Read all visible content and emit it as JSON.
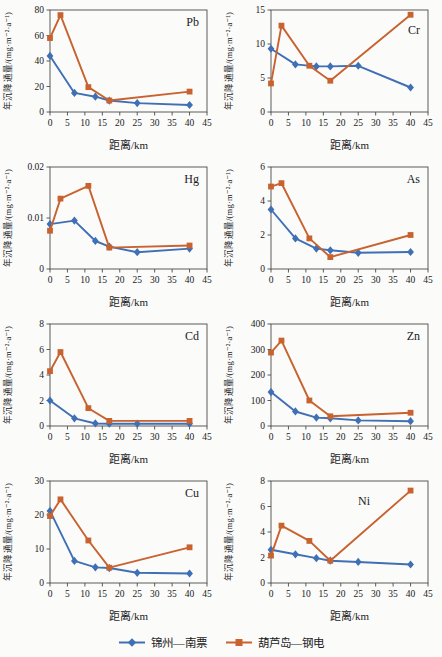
{
  "figure": {
    "background": "#fbfbfa",
    "series_styles": [
      {
        "name": "锦州—南票",
        "color": "#3f6fb5",
        "marker": "diamond"
      },
      {
        "name": "葫芦岛—钢电",
        "color": "#c8622f",
        "marker": "square"
      }
    ]
  },
  "legend": {
    "position": "bottom-center",
    "items": [
      {
        "label": "锦州—南票",
        "color": "#3f6fb5",
        "marker": "diamond"
      },
      {
        "label": "葫芦岛—钢电",
        "color": "#c8622f",
        "marker": "square"
      }
    ]
  },
  "chart_data": [
    {
      "type": "line",
      "title": "Pb",
      "xlabel": "距离/km",
      "ylabel": "年沉降通量/(mg·m⁻²·a⁻¹)",
      "xlim": [
        0,
        45
      ],
      "xtick_step": 5,
      "ylim": [
        0,
        80
      ],
      "ytick_step": 20,
      "grid": false,
      "title_offset": [
        0,
        0
      ],
      "series": [
        {
          "name": "锦州—南票",
          "x": [
            0,
            7,
            13,
            17,
            25,
            40
          ],
          "y": [
            44,
            15,
            12,
            9,
            7,
            5.5
          ]
        },
        {
          "name": "葫芦岛—钢电",
          "x": [
            0,
            3,
            11,
            17,
            40
          ],
          "y": [
            58,
            76,
            19.5,
            9,
            16
          ]
        }
      ]
    },
    {
      "type": "line",
      "title": "Cr",
      "xlabel": "距离/km",
      "ylabel": "年沉降通量/(mg·m⁻²·a⁻¹)",
      "xlim": [
        0,
        45
      ],
      "xtick_step": 5,
      "ylim": [
        0,
        15
      ],
      "ytick_step": 5,
      "grid": false,
      "title_offset": [
        0,
        8
      ],
      "series": [
        {
          "name": "锦州—南票",
          "x": [
            0,
            7,
            13,
            17,
            25,
            40
          ],
          "y": [
            9.3,
            7,
            6.7,
            6.7,
            6.8,
            3.6
          ]
        },
        {
          "name": "葫芦岛—钢电",
          "x": [
            0,
            3,
            11,
            17,
            40
          ],
          "y": [
            4.2,
            12.7,
            6.8,
            4.6,
            14.3
          ]
        }
      ]
    },
    {
      "type": "line",
      "title": "Hg",
      "xlabel": "距离/km",
      "ylabel": "年沉降通量/(mg·m⁻²·a⁻¹)",
      "xlim": [
        0,
        45
      ],
      "xtick_step": 5,
      "ylim": [
        0,
        0.02
      ],
      "ytick_step": 0.01,
      "grid": false,
      "title_offset": [
        0,
        0
      ],
      "series": [
        {
          "name": "锦州—南票",
          "x": [
            0,
            7,
            13,
            17,
            25,
            40
          ],
          "y": [
            0.0088,
            0.0095,
            0.0055,
            0.0044,
            0.0033,
            0.004
          ]
        },
        {
          "name": "葫芦岛—钢电",
          "x": [
            0,
            3,
            11,
            17,
            40
          ],
          "y": [
            0.0075,
            0.0138,
            0.0163,
            0.0042,
            0.0046
          ]
        }
      ]
    },
    {
      "type": "line",
      "title": "As",
      "xlabel": "距离/km",
      "ylabel": "年沉降通量/(mg·m⁻²·a⁻¹)",
      "xlim": [
        0,
        45
      ],
      "xtick_step": 5,
      "ylim": [
        0,
        6
      ],
      "ytick_step": 2,
      "grid": false,
      "title_offset": [
        0,
        0
      ],
      "series": [
        {
          "name": "锦州—南票",
          "x": [
            0,
            7,
            13,
            17,
            25,
            40
          ],
          "y": [
            3.5,
            1.8,
            1.2,
            1.1,
            0.95,
            1.0
          ]
        },
        {
          "name": "葫芦岛—钢电",
          "x": [
            0,
            3,
            11,
            17,
            40
          ],
          "y": [
            4.85,
            5.05,
            1.8,
            0.7,
            2.0
          ]
        }
      ]
    },
    {
      "type": "line",
      "title": "Cd",
      "xlabel": "距离/km",
      "ylabel": "年沉降通量/(mg·m⁻²·a⁻¹)",
      "xlim": [
        0,
        45
      ],
      "xtick_step": 5,
      "ylim": [
        0,
        8
      ],
      "ytick_step": 2,
      "grid": false,
      "title_offset": [
        0,
        0
      ],
      "series": [
        {
          "name": "锦州—南票",
          "x": [
            0,
            7,
            13,
            17,
            25,
            40
          ],
          "y": [
            2.0,
            0.6,
            0.2,
            0.18,
            0.18,
            0.18
          ]
        },
        {
          "name": "葫芦岛—钢电",
          "x": [
            0,
            3,
            11,
            17,
            40
          ],
          "y": [
            4.3,
            5.8,
            1.4,
            0.4,
            0.4
          ]
        }
      ]
    },
    {
      "type": "line",
      "title": "Zn",
      "xlabel": "距离/km",
      "ylabel": "年沉降通量/(mg·m⁻²·a⁻¹)",
      "xlim": [
        0,
        45
      ],
      "xtick_step": 5,
      "ylim": [
        0,
        400
      ],
      "ytick_step": 100,
      "grid": false,
      "title_offset": [
        0,
        0
      ],
      "series": [
        {
          "name": "锦州—南票",
          "x": [
            0,
            7,
            13,
            17,
            25,
            40
          ],
          "y": [
            133,
            57,
            33,
            30,
            22,
            19
          ]
        },
        {
          "name": "葫芦岛—钢电",
          "x": [
            0,
            3,
            11,
            17,
            40
          ],
          "y": [
            288,
            335,
            100,
            38,
            52
          ]
        }
      ]
    },
    {
      "type": "line",
      "title": "Cu",
      "xlabel": "距离/km",
      "ylabel": "年沉降通量/(mg·m⁻²·a⁻¹)",
      "xlim": [
        0,
        45
      ],
      "xtick_step": 5,
      "ylim": [
        0,
        30
      ],
      "ytick_step": 10,
      "grid": false,
      "title_offset": [
        0,
        0
      ],
      "series": [
        {
          "name": "锦州—南票",
          "x": [
            0,
            7,
            13,
            17,
            25,
            40
          ],
          "y": [
            21.2,
            6.5,
            4.6,
            4.4,
            3.0,
            2.8
          ]
        },
        {
          "name": "葫芦岛—钢电",
          "x": [
            0,
            3,
            11,
            17,
            40
          ],
          "y": [
            19.7,
            24.6,
            12.5,
            4.5,
            10.5
          ]
        }
      ]
    },
    {
      "type": "line",
      "title": "Ni",
      "xlabel": "距离/km",
      "ylabel": "年沉降通量/(mg·m⁻²·a⁻¹)",
      "xlim": [
        0,
        45
      ],
      "xtick_step": 5,
      "ylim": [
        0,
        8
      ],
      "ytick_step": 2,
      "grid": false,
      "title_offset": [
        -50,
        8
      ],
      "series": [
        {
          "name": "锦州—南票",
          "x": [
            0,
            7,
            13,
            17,
            25,
            40
          ],
          "y": [
            2.6,
            2.25,
            1.95,
            1.75,
            1.65,
            1.45
          ]
        },
        {
          "name": "葫芦岛—钢电",
          "x": [
            0,
            3,
            11,
            17,
            40
          ],
          "y": [
            2.15,
            4.5,
            3.3,
            1.75,
            7.25
          ]
        }
      ]
    }
  ]
}
